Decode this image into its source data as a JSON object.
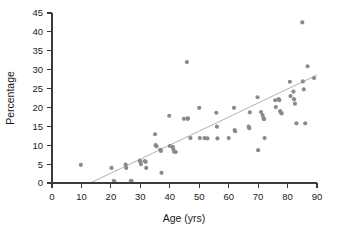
{
  "chart_data": {
    "type": "scatter",
    "title": "",
    "xlabel": "Age (yrs)",
    "ylabel": "Percentage",
    "xlim": [
      0,
      90
    ],
    "ylim": [
      0,
      45
    ],
    "xticks": [
      0,
      10,
      20,
      30,
      40,
      50,
      60,
      70,
      80,
      90
    ],
    "yticks": [
      0,
      5,
      10,
      15,
      20,
      25,
      30,
      35,
      40,
      45
    ],
    "grid": false,
    "legend": null,
    "marker_color": "#8a8a8a",
    "trendline_color": "#a8a8a8",
    "axis_color": "#3a3a3a",
    "x": [
      9.8,
      20.2,
      21.0,
      21.2,
      25.0,
      25.2,
      26.8,
      27.0,
      29.8,
      30.0,
      30.2,
      31.5,
      31.8,
      32.0,
      35.0,
      35.2,
      35.5,
      36.8,
      37.0,
      37.2,
      39.8,
      40.0,
      41.0,
      41.2,
      41.5,
      42.0,
      44.8,
      45.8,
      46.0,
      46.2,
      47.0,
      50.0,
      50.2,
      51.8,
      52.8,
      55.8,
      56.0,
      56.2,
      60.0,
      61.8,
      62.0,
      62.2,
      66.8,
      67.0,
      67.2,
      69.8,
      70.0,
      71.0,
      71.5,
      71.8,
      72.0,
      72.2,
      75.8,
      76.0,
      77.0,
      77.2,
      77.5,
      77.8,
      78.0,
      80.8,
      81.0,
      82.0,
      82.2,
      82.5,
      83.0,
      85.0,
      85.2,
      85.5,
      86.0,
      86.8,
      89.0
    ],
    "y": [
      4.8,
      4.0,
      0.6,
      0.3,
      4.9,
      4.0,
      0.6,
      0.5,
      5.9,
      5.7,
      5.0,
      5.8,
      5.6,
      4.0,
      12.9,
      10.0,
      9.7,
      8.8,
      8.5,
      2.7,
      17.8,
      9.8,
      9.6,
      9.0,
      8.3,
      8.2,
      17.0,
      32.0,
      17.0,
      17.1,
      11.9,
      19.9,
      11.9,
      11.9,
      11.8,
      18.6,
      14.9,
      11.8,
      11.9,
      19.9,
      14.0,
      13.7,
      14.9,
      14.5,
      18.7,
      22.7,
      8.7,
      18.8,
      18.0,
      17.2,
      16.9,
      11.9,
      21.9,
      20.1,
      22.2,
      21.9,
      19.0,
      18.6,
      18.4,
      26.8,
      23.0,
      24.2,
      22.2,
      21.0,
      15.8,
      42.5,
      26.9,
      24.8,
      15.8,
      30.9,
      27.8
    ],
    "trendline": {
      "x0": 13.0,
      "y0": 0.0,
      "x1": 90.0,
      "y1": 28.6
    }
  },
  "axis": {
    "x_title": "Age (yrs)",
    "y_title": "Percentage",
    "x_tick_labels": [
      "0",
      "10",
      "20",
      "30",
      "40",
      "50",
      "60",
      "70",
      "80",
      "90"
    ],
    "y_tick_labels": [
      "0",
      "5",
      "10",
      "15",
      "20",
      "25",
      "30",
      "35",
      "40",
      "45"
    ]
  }
}
